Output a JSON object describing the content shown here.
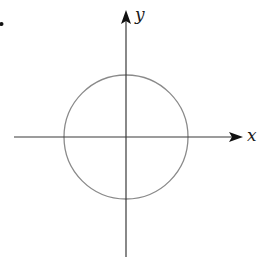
{
  "diagram": {
    "type": "coordinate-plane-with-circle",
    "labels": {
      "x_axis": "x",
      "y_axis": "y"
    },
    "geometry": {
      "origin": [
        126,
        137
      ],
      "circle_radius": 62,
      "x_axis_start": 14,
      "x_axis_end": 242,
      "y_axis_top": 11,
      "y_axis_bottom": 257
    },
    "colors": {
      "axis": "#2a2a2a",
      "circle": "#8a8a8a",
      "arrowhead": "#111111",
      "marker_dot": "#111111"
    }
  }
}
